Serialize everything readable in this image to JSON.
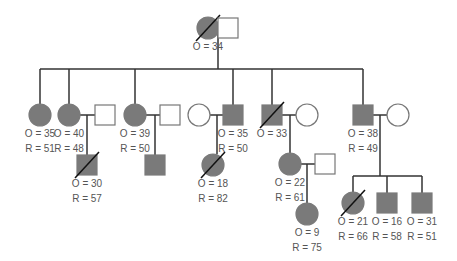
{
  "colors": {
    "affected": "#7a7a7a",
    "line": "#333333",
    "unaffected": "#ffffff",
    "border": "#777777"
  },
  "generation1": [
    {
      "id": "g1f",
      "sex": "female",
      "affected": true,
      "deceased": true,
      "x": 208,
      "y": 28,
      "onset": "O = 34",
      "rec": ""
    },
    {
      "id": "g1m",
      "sex": "male",
      "affected": false,
      "deceased": false,
      "x": 228,
      "y": 28,
      "onset": "",
      "rec": ""
    }
  ],
  "generation2": [
    {
      "id": "a",
      "sex": "female",
      "affected": true,
      "deceased": false,
      "x": 40,
      "y": 115,
      "onset": "O = 35",
      "rec": "R = 51"
    },
    {
      "id": "b",
      "sex": "female",
      "affected": true,
      "deceased": false,
      "x": 69,
      "y": 115,
      "onset": "O = 40",
      "rec": "R = 48"
    },
    {
      "id": "bs",
      "sex": "male",
      "affected": false,
      "deceased": false,
      "x": 105,
      "y": 115,
      "onset": "",
      "rec": ""
    },
    {
      "id": "c",
      "sex": "female",
      "affected": true,
      "deceased": false,
      "x": 135,
      "y": 115,
      "onset": "O = 39",
      "rec": "R = 50"
    },
    {
      "id": "cs",
      "sex": "male",
      "affected": false,
      "deceased": false,
      "x": 170,
      "y": 115,
      "onset": "",
      "rec": ""
    },
    {
      "id": "ds",
      "sex": "female",
      "affected": false,
      "deceased": false,
      "x": 199,
      "y": 115,
      "onset": "",
      "rec": ""
    },
    {
      "id": "d",
      "sex": "male",
      "affected": true,
      "deceased": false,
      "x": 233,
      "y": 115,
      "onset": "O = 35",
      "rec": "R = 50"
    },
    {
      "id": "e",
      "sex": "male",
      "affected": true,
      "deceased": true,
      "x": 272,
      "y": 115,
      "onset": "O = 33",
      "rec": ""
    },
    {
      "id": "es",
      "sex": "female",
      "affected": false,
      "deceased": false,
      "x": 307,
      "y": 115,
      "onset": "",
      "rec": ""
    },
    {
      "id": "f",
      "sex": "male",
      "affected": true,
      "deceased": false,
      "x": 363,
      "y": 115,
      "onset": "O = 38",
      "rec": "R = 49"
    },
    {
      "id": "fs",
      "sex": "female",
      "affected": false,
      "deceased": false,
      "x": 398,
      "y": 115,
      "onset": "",
      "rec": ""
    }
  ],
  "generation3": [
    {
      "id": "b1",
      "sex": "male",
      "affected": true,
      "deceased": true,
      "x": 87,
      "y": 165,
      "onset": "O = 30",
      "rec": "R = 57"
    },
    {
      "id": "c1",
      "sex": "male",
      "affected": true,
      "deceased": false,
      "x": 155,
      "y": 165,
      "onset": "",
      "rec": ""
    },
    {
      "id": "d1",
      "sex": "female",
      "affected": true,
      "deceased": true,
      "x": 213,
      "y": 165,
      "onset": "O = 18",
      "rec": "R = 82"
    },
    {
      "id": "e1",
      "sex": "female",
      "affected": true,
      "deceased": false,
      "x": 290,
      "y": 164,
      "onset": "O = 22",
      "rec": "R = 61"
    },
    {
      "id": "e1s",
      "sex": "male",
      "affected": false,
      "deceased": false,
      "x": 325,
      "y": 164,
      "onset": "",
      "rec": ""
    },
    {
      "id": "f1",
      "sex": "female",
      "affected": true,
      "deceased": true,
      "x": 353,
      "y": 203,
      "onset": "O = 21",
      "rec": "R = 66"
    },
    {
      "id": "f2",
      "sex": "male",
      "affected": true,
      "deceased": false,
      "x": 387,
      "y": 203,
      "onset": "O = 16",
      "rec": "R = 58"
    },
    {
      "id": "f3",
      "sex": "male",
      "affected": true,
      "deceased": false,
      "x": 422,
      "y": 203,
      "onset": "O = 31",
      "rec": "R = 51"
    }
  ],
  "generation4": [
    {
      "id": "e1a",
      "sex": "female",
      "affected": true,
      "deceased": false,
      "x": 307,
      "y": 214,
      "onset": "O = 9",
      "rec": "R = 75"
    }
  ],
  "lines": [
    [
      219,
      28,
      218,
      28
    ],
    [
      197,
      28,
      238,
      28
    ],
    [
      218,
      28,
      218,
      69
    ],
    [
      40,
      69,
      363,
      69
    ],
    [
      40,
      69,
      40,
      104
    ],
    [
      69,
      69,
      69,
      104
    ],
    [
      135,
      69,
      135,
      104
    ],
    [
      233,
      69,
      233,
      105
    ],
    [
      272,
      69,
      272,
      105
    ],
    [
      363,
      69,
      363,
      105
    ],
    [
      80,
      115,
      95,
      115
    ],
    [
      87,
      115,
      87,
      155
    ],
    [
      146,
      115,
      160,
      115
    ],
    [
      155,
      115,
      155,
      155
    ],
    [
      210,
      115,
      223,
      115
    ],
    [
      217,
      115,
      217,
      154
    ],
    [
      282,
      115,
      296,
      115
    ],
    [
      290,
      115,
      290,
      153
    ],
    [
      373,
      115,
      387,
      115
    ],
    [
      380,
      115,
      380,
      176
    ],
    [
      353,
      176,
      422,
      176
    ],
    [
      353,
      176,
      353,
      192
    ],
    [
      387,
      176,
      387,
      193
    ],
    [
      422,
      176,
      422,
      193
    ],
    [
      301,
      164,
      315,
      164
    ],
    [
      307,
      164,
      307,
      203
    ]
  ]
}
